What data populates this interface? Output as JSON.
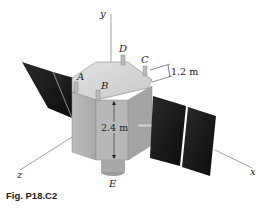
{
  "figure": {
    "caption": "Fig. P18.C2",
    "axes": {
      "x": "x",
      "y": "y",
      "z": "z"
    },
    "points": {
      "A": "A",
      "B": "B",
      "C": "C",
      "D": "D",
      "E": "E"
    },
    "dimensions": {
      "height": "2.4 m",
      "offset": "1.2 m"
    }
  }
}
